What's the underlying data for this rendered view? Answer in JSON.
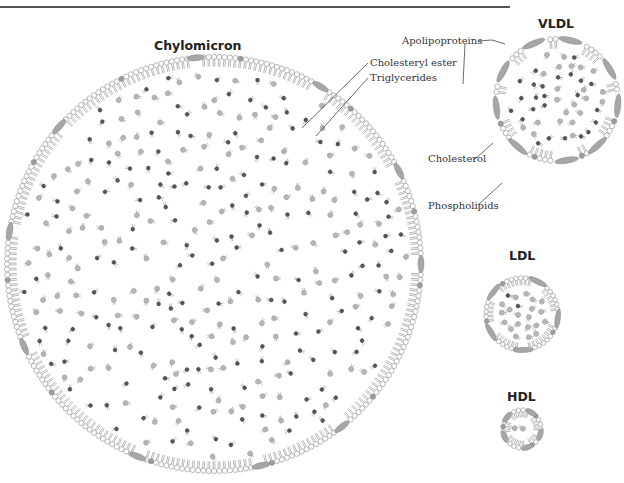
{
  "diagram": {
    "colors": {
      "shell_stroke": "#8a8a8a",
      "head_fill": "#ffffff",
      "protein_fill": "#a6a6a6",
      "cholesterol_fill": "#9c9c9c",
      "ester_dark": "#555555",
      "triglyceride_light": "#b5b5b5",
      "text": "#333333"
    },
    "particles": [
      {
        "id": "chylomicron",
        "title": "Chylomicron",
        "cx": 214,
        "cy": 264,
        "r": 207,
        "core_density": 330,
        "proteins": 10
      },
      {
        "id": "vldl",
        "title": "VLDL",
        "cx": 557,
        "cy": 100,
        "r": 61,
        "core_density": 46,
        "proteins": 9
      },
      {
        "id": "ldl",
        "title": "LDL",
        "cx": 522,
        "cy": 314,
        "r": 36,
        "core_density": 24,
        "proteins": 5
      },
      {
        "id": "hdl",
        "title": "HDL",
        "cx": 522,
        "cy": 429,
        "r": 19,
        "core_density": 6,
        "proteins": 5
      }
    ],
    "labels": {
      "cholesteryl_ester": "Cholesteryl ester",
      "triglycerides": "Triglycerides",
      "apolipoproteins": "Apolipoproteins",
      "cholesterol": "Cholesterol",
      "phospholipids": "Phospholipids"
    },
    "titles": {
      "chylomicron": "Chylomicron",
      "vldl": "VLDL",
      "ldl": "LDL",
      "hdl": "HDL"
    }
  }
}
